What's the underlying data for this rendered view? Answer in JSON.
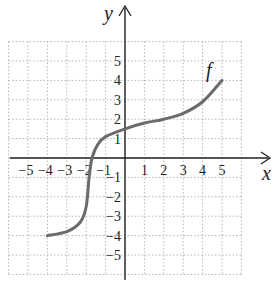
{
  "chart_data": {
    "type": "line",
    "title": "",
    "xlabel": "x",
    "ylabel": "y",
    "xlim": [
      -6,
      6
    ],
    "ylim": [
      -6,
      6
    ],
    "grid": true,
    "x_ticks": [
      "−5",
      "−4",
      "−3",
      "−2",
      "−1",
      "1",
      "2",
      "3",
      "4",
      "5"
    ],
    "y_ticks": [
      "5",
      "4",
      "3",
      "2",
      "1",
      "−1",
      "−2",
      "−3",
      "−4",
      "−5"
    ],
    "series": [
      {
        "name": "f",
        "x": [
          -4,
          -3,
          -2.3,
          -2.0,
          -1.85,
          -1.7,
          -1.4,
          -1,
          0,
          1,
          2,
          3,
          4,
          5
        ],
        "values": [
          -4,
          -3.8,
          -3.3,
          -2.5,
          -1,
          0,
          0.7,
          1.1,
          1.5,
          1.8,
          2,
          2.3,
          2.9,
          4
        ]
      }
    ],
    "annotations": [
      {
        "text": "f",
        "x": 4.7,
        "y": 4.6
      }
    ],
    "colors": {
      "curve": "#6b6b6b",
      "axes": "#222222",
      "grid": "#b5b5b5"
    }
  }
}
